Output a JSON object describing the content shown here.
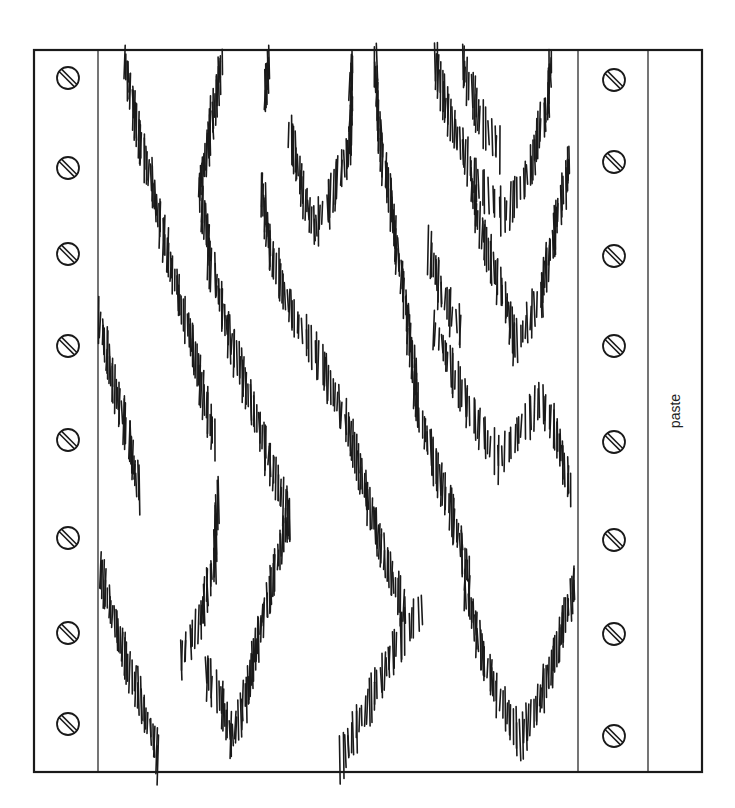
{
  "sheet": {
    "paste_label": "paste",
    "colors": {
      "ink": "#1a1a1a",
      "paper": "#ffffff"
    },
    "frame": {
      "x": 34,
      "y": 50,
      "width": 668,
      "height": 722
    },
    "dividers": [
      98,
      578,
      648
    ],
    "screws": {
      "left_x": 68,
      "right_x": 614,
      "ys": [
        78,
        168,
        254,
        346,
        440,
        538,
        633,
        724
      ],
      "right_ys": [
        80,
        162,
        256,
        346,
        442,
        540,
        634,
        736
      ],
      "radius": 11
    },
    "grain_icon": "wood-grain-pattern"
  }
}
